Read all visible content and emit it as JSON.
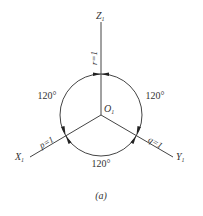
{
  "figure": {
    "caption": "(a)",
    "colors": {
      "line": "#444444",
      "text": "#333333",
      "background": "#ffffff"
    }
  },
  "axes": {
    "z": {
      "label": "Z",
      "subscript": "1",
      "scale_label": "r=1"
    },
    "x": {
      "label": "X",
      "subscript": "1",
      "scale_label": "p=1"
    },
    "y": {
      "label": "Y",
      "subscript": "1",
      "scale_label": "q=1"
    }
  },
  "origin": {
    "label": "O",
    "subscript": "1"
  },
  "angles": {
    "left": "120°",
    "right": "120°",
    "bottom": "120°"
  }
}
